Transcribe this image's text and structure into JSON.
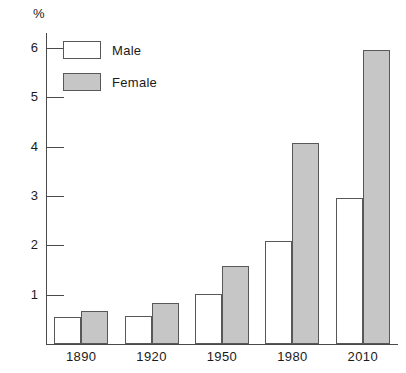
{
  "chart_data": {
    "type": "bar",
    "title": "",
    "subtitle": "",
    "xlabel": "",
    "ylabel": "%",
    "categories": [
      "1890",
      "1920",
      "1950",
      "1980",
      "2010"
    ],
    "series": [
      {
        "name": "Male",
        "values": [
          0.54,
          0.57,
          1.02,
          2.09,
          2.95
        ],
        "color": "#ffffff"
      },
      {
        "name": "Female",
        "values": [
          0.66,
          0.83,
          1.58,
          4.08,
          5.95
        ],
        "color": "#c6c6c6"
      }
    ],
    "ylim": [
      0,
      6.3
    ],
    "y_ticks": [
      "1",
      "2",
      "3",
      "4",
      "5",
      "6"
    ],
    "grid": false,
    "legend_position": "top-left",
    "annotations": []
  },
  "axis": {
    "y_unit_label": "%",
    "y_tick_labels": [
      "6",
      "5",
      "4",
      "3",
      "2",
      "1"
    ],
    "x_tick_labels": [
      "1890",
      "1920",
      "1950",
      "1980",
      "2010"
    ]
  },
  "legend": {
    "items": [
      {
        "label": "Male",
        "swatch": "white-square-icon"
      },
      {
        "label": "Female",
        "swatch": "gray-square-icon"
      }
    ]
  }
}
